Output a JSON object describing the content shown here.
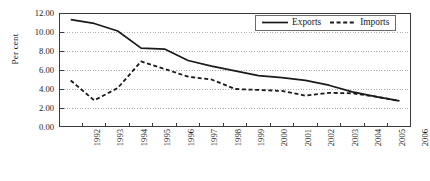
{
  "chart_data": {
    "type": "line",
    "title": "",
    "xlabel": "",
    "ylabel": "Per cent",
    "ylim": [
      0.0,
      12.0
    ],
    "ytick_step": 2.0,
    "grid": true,
    "legend_position": "top-right",
    "categories": [
      "1992",
      "1993",
      "1994",
      "1995",
      "1996",
      "1997",
      "1998",
      "1999",
      "2000",
      "2001",
      "2002",
      "2003",
      "2004",
      "2005",
      "2006"
    ],
    "yticks": [
      "0.00",
      "2.00",
      "4.00",
      "6.00",
      "8.00",
      "10.00",
      "12.00"
    ],
    "series": [
      {
        "name": "Exports",
        "style": "solid",
        "color": "#1a1a1a",
        "values": [
          11.3,
          10.9,
          10.1,
          8.3,
          8.2,
          7.0,
          6.4,
          5.9,
          5.4,
          5.2,
          4.9,
          4.4,
          3.7,
          3.2,
          2.75
        ]
      },
      {
        "name": "Imports",
        "style": "dashed",
        "color": "#1a1a1a",
        "values": [
          4.9,
          2.8,
          4.1,
          6.9,
          6.1,
          5.3,
          5.0,
          4.0,
          3.9,
          3.8,
          3.3,
          3.6,
          3.55,
          3.2,
          2.75
        ]
      }
    ]
  },
  "legend": {
    "entries": [
      {
        "label": "Exports"
      },
      {
        "label": "Imports"
      }
    ]
  },
  "axis": {
    "y_title": "Per cent"
  },
  "colors": {
    "line": "#1a1a1a",
    "grid": "#9a9a9a",
    "frame": "#3a3a3a",
    "background": "#ffffff"
  }
}
